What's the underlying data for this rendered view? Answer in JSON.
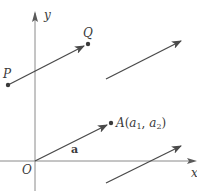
{
  "diagram": {
    "colors": {
      "axis": "#8a8a8a",
      "vector": "#4a4a4a",
      "point": "#3a3a3a",
      "text": "#3a3a3a"
    },
    "axes": {
      "x_label": "x",
      "y_label": "y",
      "origin_label": "O"
    },
    "points": {
      "P": {
        "label": "P",
        "x": 8,
        "y": 85
      },
      "Q": {
        "label": "Q",
        "x": 88,
        "y": 44
      },
      "A": {
        "label": "A",
        "coords": "(a1, a2)",
        "x": 111,
        "y": 123
      }
    },
    "vectors": [
      {
        "name": "PQ",
        "from": [
          8,
          85
        ],
        "to": [
          84,
          46
        ]
      },
      {
        "name": "a",
        "label": "a",
        "from": [
          35,
          161
        ],
        "to": [
          107,
          125
        ]
      },
      {
        "name": "copy-upper-right",
        "from": [
          106,
          79
        ],
        "to": [
          181,
          41
        ]
      },
      {
        "name": "copy-lower-right",
        "from": [
          106,
          183
        ],
        "to": [
          181,
          146
        ]
      }
    ],
    "labels": {
      "P": "P",
      "Q": "Q",
      "A": "A",
      "a1": "a",
      "a1_sub": "1",
      "a2": "a",
      "a2_sub": "2",
      "vector_a": "a",
      "open_paren": "(",
      "comma": ", ",
      "close_paren": ")"
    }
  }
}
